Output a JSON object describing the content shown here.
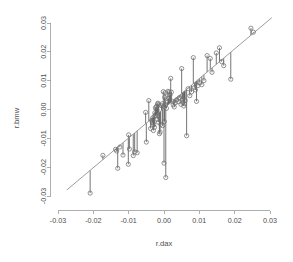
{
  "chart_data": {
    "type": "scatter",
    "title": "",
    "subtitle": "",
    "xlabel": "r.dax",
    "ylabel": "r.bmw",
    "xlim": [
      -0.033,
      0.033
    ],
    "ylim": [
      -0.033,
      0.033
    ],
    "xticks": [
      -0.03,
      -0.02,
      -0.01,
      0.0,
      0.01,
      0.02,
      0.03
    ],
    "yticks": [
      -0.03,
      -0.02,
      -0.01,
      0.0,
      0.01,
      0.02,
      0.03
    ],
    "xticklabels": [
      "-0.03",
      "-0.02",
      "-0.01",
      "0.00",
      "0.01",
      "0.02",
      "0.03"
    ],
    "yticklabels": [
      "-0.03",
      "-0.02",
      "-0.01",
      "0.00",
      "0.01",
      "0.02",
      "0.03"
    ],
    "grid": false,
    "legend": false,
    "legend_position": "none",
    "point_marker": "open-circle",
    "point_color": "#6f6f6f",
    "line_color": "#8a8a8a",
    "residual_color": "#3a3a3a",
    "background_color": "#ffffff",
    "annotations": [
      "Simple linear regression of r.bmw on r.dax with vertical residual segments drawn from each observation to the fitted line."
    ],
    "fit_line": {
      "name": "least-squares fit",
      "intercept": 0.00042,
      "slope": 1.03,
      "x_start": -0.0275,
      "x_end": 0.0305
    },
    "series": [
      {
        "name": "observations",
        "x": [
          -0.0209,
          -0.0173,
          -0.0137,
          -0.0134,
          -0.0131,
          -0.0125,
          -0.0116,
          -0.0101,
          -0.01,
          -0.0098,
          -0.0087,
          -0.0083,
          -0.0076,
          -0.0052,
          -0.005,
          -0.0043,
          -0.0038,
          -0.0035,
          -0.0033,
          -0.0032,
          -0.0031,
          -0.003,
          -0.0029,
          -0.0028,
          -0.0027,
          -0.0026,
          -0.0025,
          -0.0024,
          -0.0023,
          -0.0022,
          -0.0021,
          -0.002,
          -0.0019,
          -0.0018,
          -0.0017,
          -0.0016,
          -0.0015,
          -0.0013,
          -0.0011,
          -0.0009,
          -0.0007,
          -0.0005,
          -0.0004,
          -0.0002,
          0.0,
          0.0001,
          0.0002,
          0.0003,
          0.0004,
          0.0005,
          0.0007,
          0.0009,
          0.0011,
          0.0013,
          0.0015,
          0.0017,
          0.0019,
          0.0021,
          0.0023,
          0.0026,
          0.0029,
          0.0032,
          0.0036,
          0.004,
          0.0044,
          0.0048,
          0.005,
          0.0052,
          0.0054,
          0.0056,
          0.0058,
          0.006,
          0.0064,
          0.0068,
          0.0073,
          0.0078,
          0.0083,
          0.0086,
          0.0089,
          0.0092,
          0.0096,
          0.0101,
          0.0107,
          0.0113,
          0.0122,
          0.0131,
          0.0136,
          0.0148,
          0.0157,
          0.0163,
          0.0169,
          0.0189,
          0.0246,
          0.0253
        ],
        "y": [
          -0.029,
          -0.0159,
          -0.0138,
          -0.0144,
          -0.0204,
          -0.013,
          -0.0158,
          -0.019,
          -0.0088,
          -0.0137,
          -0.016,
          -0.0147,
          -0.015,
          -0.001,
          -0.0113,
          0.0031,
          -0.0066,
          -0.0038,
          -0.0046,
          -0.0029,
          -0.0044,
          -0.0073,
          -0.0053,
          -0.0026,
          -0.0062,
          -0.0012,
          -0.002,
          0.0007,
          0.0002,
          -0.0015,
          0.0011,
          -0.0001,
          -0.0034,
          0.0019,
          0.0022,
          -0.0044,
          0.0016,
          -0.0084,
          -0.0078,
          -0.0052,
          0.0013,
          0.002,
          -0.0056,
          0.0062,
          -0.0186,
          -0.0042,
          0.0042,
          0.0058,
          0.0017,
          -0.0236,
          0.0004,
          0.0025,
          0.0063,
          0.0038,
          0.0061,
          0.005,
          0.0108,
          0.006,
          0.0029,
          0.0016,
          0.0009,
          0.0023,
          0.0034,
          0.0027,
          0.0041,
          0.0018,
          0.0142,
          0.0035,
          0.0024,
          0.0012,
          0.002,
          0.0031,
          -0.0091,
          0.0072,
          0.0048,
          0.0061,
          0.018,
          0.0076,
          0.0068,
          0.0028,
          0.0083,
          0.0093,
          0.0086,
          0.01,
          0.0187,
          0.0177,
          0.0129,
          0.0196,
          0.0214,
          0.0166,
          0.0152,
          0.0105,
          0.0282,
          0.0268
        ]
      }
    ]
  },
  "axes": {
    "x_title": "r.dax",
    "y_title": "r.bmw"
  }
}
